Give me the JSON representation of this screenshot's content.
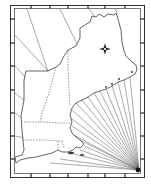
{
  "map": {
    "subject": "New England outline map with rhumb lines",
    "regions": [
      "Maine",
      "New Hampshire",
      "Vermont",
      "Massachusetts",
      "Rhode Island",
      "Connecticut"
    ],
    "features": {
      "compass_rose": "compass-rose-icon",
      "rhumb_line_hub": "bottom-right corner",
      "rhumb_line_count": 20
    },
    "colors": {
      "background": "#ffffff",
      "land": "#ffffff",
      "ink": "#222222"
    },
    "frame": {
      "outer": [
        10,
        5,
        144,
        177
      ],
      "inner": [
        14,
        8,
        140,
        173
      ],
      "top_ticks_x": [
        31,
        50,
        68,
        88,
        105,
        125
      ],
      "left_ticks_y": [
        19,
        43,
        66,
        90,
        113,
        136,
        159
      ]
    }
  }
}
